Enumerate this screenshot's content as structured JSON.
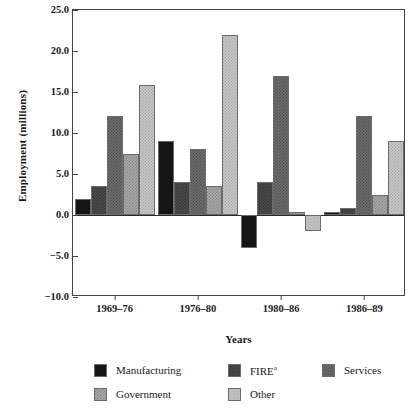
{
  "chart_data": {
    "type": "bar",
    "title": "",
    "subtitle": "",
    "xlabel": "Years",
    "ylabel": "Employment (millions)",
    "categories": [
      "1969–76",
      "1976–80",
      "1980–86",
      "1986–89"
    ],
    "series": [
      {
        "name": "Manufacturing",
        "values": [
          2.0,
          9.0,
          -4.0,
          0.4
        ],
        "color": "#151515"
      },
      {
        "name": "FIRE",
        "label_sup": "a",
        "values": [
          3.5,
          4.0,
          4.0,
          0.9
        ],
        "color": "#3a3a3a"
      },
      {
        "name": "Services",
        "values": [
          12.1,
          8.0,
          16.9,
          12.1
        ],
        "color": "#6e6e6e"
      },
      {
        "name": "Government",
        "values": [
          7.5,
          3.5,
          0.4,
          2.5
        ],
        "color": "#a8a8a8"
      },
      {
        "name": "Other",
        "values": [
          15.9,
          22.0,
          -2.0,
          9.0
        ],
        "color": "#c8c8c8"
      }
    ],
    "ylim": [
      -10.0,
      25.0
    ],
    "yticks": [
      25.0,
      20.0,
      15.0,
      10.0,
      5.0,
      0.0,
      -5.0,
      -10.0
    ],
    "ytick_labels": [
      "25.0",
      "20.0",
      "15.0",
      "10.0",
      "5.0",
      "0.0",
      "−5.0",
      "−10.0"
    ],
    "grid": false,
    "legend_position": "bottom",
    "zero_line": 0.0
  },
  "legend": {
    "items": [
      {
        "label": "Manufacturing",
        "sup": "",
        "key": "manufacturing"
      },
      {
        "label": "FIRE",
        "sup": "a",
        "key": "fire"
      },
      {
        "label": "Services",
        "sup": "",
        "key": "services"
      },
      {
        "label": "Government",
        "sup": "",
        "key": "government"
      },
      {
        "label": "Other",
        "sup": "",
        "key": "other"
      }
    ]
  },
  "axes": {
    "y_title": "Employment (millions)",
    "x_title": "Years"
  }
}
